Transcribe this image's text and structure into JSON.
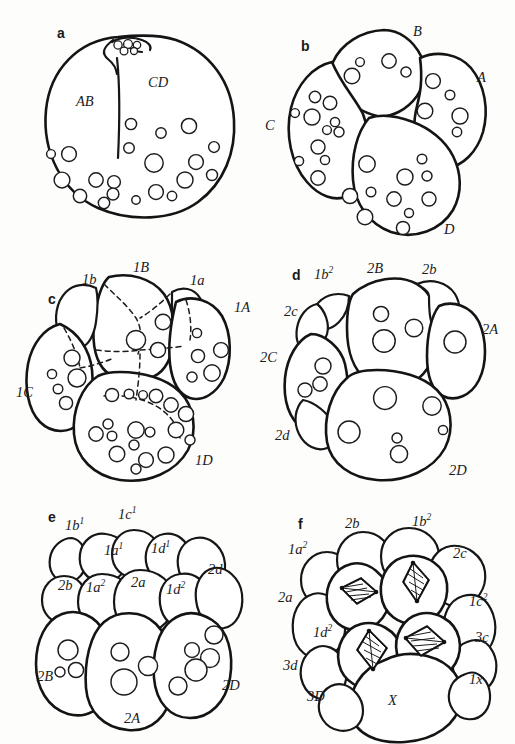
{
  "figure": {
    "background_color": "#fdfdfb",
    "ink_color": "#141414",
    "panels": [
      {
        "id": "a",
        "letter": "a",
        "stage": "2-cell stage",
        "labels": [
          {
            "name": "label-ab",
            "text": "AB",
            "sup": ""
          },
          {
            "name": "label-cd",
            "text": "CD",
            "sup": ""
          }
        ],
        "features": [
          "polar-bodies",
          "cleavage-furrow",
          "yolk-granules"
        ]
      },
      {
        "id": "b",
        "letter": "b",
        "stage": "4-cell stage",
        "labels": [
          {
            "name": "label-b",
            "text": "B",
            "sup": ""
          },
          {
            "name": "label-a",
            "text": "A",
            "sup": ""
          },
          {
            "name": "label-c",
            "text": "C",
            "sup": ""
          },
          {
            "name": "label-d",
            "text": "D",
            "sup": ""
          }
        ],
        "features": [
          "yolk-granules"
        ]
      },
      {
        "id": "c",
        "letter": "c",
        "stage": "8-cell stage, first quartet",
        "labels": [
          {
            "name": "label-1b-micromere",
            "text": "1b",
            "sup": ""
          },
          {
            "name": "label-1B-macromere",
            "text": "1B",
            "sup": ""
          },
          {
            "name": "label-1a-micromere",
            "text": "1a",
            "sup": ""
          },
          {
            "name": "label-1A-macromere",
            "text": "1A",
            "sup": ""
          },
          {
            "name": "label-1C-macromere",
            "text": "1C",
            "sup": ""
          },
          {
            "name": "label-1D-macromere",
            "text": "1D",
            "sup": ""
          }
        ],
        "features": [
          "hidden-cell-outlines-dashed",
          "yolk-granules"
        ]
      },
      {
        "id": "d",
        "letter": "d",
        "stage": "second quartet formation",
        "labels": [
          {
            "name": "label-1b2",
            "text": "1b",
            "sup": "2"
          },
          {
            "name": "label-2B",
            "text": "2B",
            "sup": ""
          },
          {
            "name": "label-2b",
            "text": "2b",
            "sup": ""
          },
          {
            "name": "label-2c",
            "text": "2c",
            "sup": ""
          },
          {
            "name": "label-2A",
            "text": "2A",
            "sup": ""
          },
          {
            "name": "label-2C",
            "text": "2C",
            "sup": ""
          },
          {
            "name": "label-2d",
            "text": "2d",
            "sup": ""
          },
          {
            "name": "label-2D",
            "text": "2D",
            "sup": ""
          }
        ],
        "features": [
          "yolk-granules"
        ]
      },
      {
        "id": "e",
        "letter": "e",
        "stage": "micromere subdivision",
        "labels": [
          {
            "name": "label-1b1",
            "text": "1b",
            "sup": "1"
          },
          {
            "name": "label-1c1",
            "text": "1c",
            "sup": "1"
          },
          {
            "name": "label-1a1",
            "text": "1a",
            "sup": "1"
          },
          {
            "name": "label-1d1",
            "text": "1d",
            "sup": "1"
          },
          {
            "name": "label-2b",
            "text": "2b",
            "sup": ""
          },
          {
            "name": "label-1a2",
            "text": "1a",
            "sup": "2"
          },
          {
            "name": "label-2a",
            "text": "2a",
            "sup": ""
          },
          {
            "name": "label-1d2",
            "text": "1d",
            "sup": "2"
          },
          {
            "name": "label-2d",
            "text": "2d",
            "sup": ""
          },
          {
            "name": "label-2B",
            "text": "2B",
            "sup": ""
          },
          {
            "name": "label-2A",
            "text": "2A",
            "sup": ""
          },
          {
            "name": "label-2D",
            "text": "2D",
            "sup": ""
          }
        ],
        "features": [
          "yolk-granules"
        ]
      },
      {
        "id": "f",
        "letter": "f",
        "stage": "third quartet, dividing micromeres",
        "labels": [
          {
            "name": "label-2b",
            "text": "2b",
            "sup": ""
          },
          {
            "name": "label-1b2",
            "text": "1b",
            "sup": "2"
          },
          {
            "name": "label-1a2",
            "text": "1a",
            "sup": "2"
          },
          {
            "name": "label-2c",
            "text": "2c",
            "sup": ""
          },
          {
            "name": "label-2a",
            "text": "2a",
            "sup": ""
          },
          {
            "name": "label-1c2",
            "text": "1c",
            "sup": "2"
          },
          {
            "name": "label-1d2",
            "text": "1d",
            "sup": "2"
          },
          {
            "name": "label-3c",
            "text": "3c",
            "sup": ""
          },
          {
            "name": "label-3d",
            "text": "3d",
            "sup": ""
          },
          {
            "name": "label-1x",
            "text": "1x",
            "sup": ""
          },
          {
            "name": "label-X",
            "text": "X",
            "sup": ""
          },
          {
            "name": "label-3D",
            "text": "3D",
            "sup": ""
          }
        ],
        "features": [
          "mitotic-spindles",
          "four-spindles"
        ]
      }
    ]
  }
}
